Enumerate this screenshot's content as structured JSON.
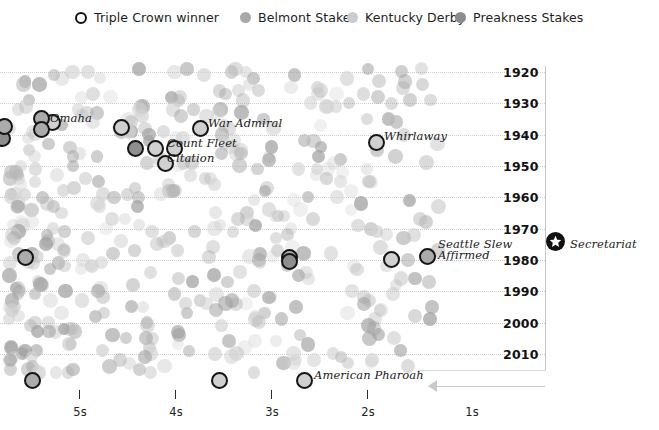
{
  "legend": {
    "items": [
      {
        "name": "triple-crown-winner",
        "label": "Triple Crown winner",
        "marker": "ring",
        "color": "#101010",
        "x": 75
      },
      {
        "name": "belmont-stakes",
        "label": "Belmont Stakes",
        "marker": "dot",
        "color": "#a8a8a8",
        "x": 240
      },
      {
        "name": "kentucky-derby",
        "label": "Kentucky Derby",
        "marker": "dot",
        "color": "#c9c9c9",
        "x": 347
      },
      {
        "name": "preakness-stakes",
        "label": "Preakness Stakes",
        "marker": "dot",
        "color": "#8c8c8c",
        "x": 455
      }
    ]
  },
  "axes": {
    "y": {
      "name": "year-axis",
      "ticks": [
        "1920",
        "1930",
        "1940",
        "1950",
        "1960",
        "1970",
        "1980",
        "1990",
        "2000",
        "2010"
      ],
      "min": 1920,
      "max": 2010
    },
    "x": {
      "name": "margin-axis",
      "ticks": [
        "5s",
        "4s",
        "3s",
        "2s",
        "1s"
      ],
      "direction_hint": "arrow-left"
    }
  },
  "chart_data": {
    "type": "scatter",
    "title": "",
    "xlabel": "",
    "ylabel": "",
    "xlim": [
      5.6,
      0.4
    ],
    "ylim": [
      1917,
      2016
    ],
    "grid": true,
    "legend_position": "top",
    "series": [
      {
        "name": "Belmont Stakes",
        "color": "#a8a8a8"
      },
      {
        "name": "Kentucky Derby",
        "color": "#c9c9c9"
      },
      {
        "name": "Preakness Stakes",
        "color": "#8c8c8c"
      }
    ],
    "annotations": [
      {
        "label": "Omaha",
        "year": 1935,
        "x_px": 120,
        "y_px": 118
      },
      {
        "label": "War Admiral",
        "year": 1937,
        "x_px": 207,
        "y_px": 123
      },
      {
        "label": "Count Fleet",
        "year": 1943,
        "x_px": 166,
        "y_px": 143
      },
      {
        "label": "Citation",
        "year": 1948,
        "x_px": 166,
        "y_px": 158
      },
      {
        "label": "Whirlaway",
        "year": 1941,
        "x_px": 383,
        "y_px": 136
      },
      {
        "label": "Seattle Slew",
        "year": 1977,
        "x_px": 437,
        "y_px": 244
      },
      {
        "label": "Affirmed",
        "year": 1978,
        "x_px": 437,
        "y_px": 254
      },
      {
        "label": "American Pharoah",
        "year": 2015,
        "x_px": 313,
        "y_px": 375
      },
      {
        "label": "Secretariat",
        "year": 1973,
        "x_px": 572,
        "y_px": 238
      }
    ],
    "triple_crown_winners": [
      {
        "label": "Sir Barton",
        "x_px": 46,
        "y_px": 118
      },
      {
        "label": "Gallant Fox",
        "x_px": 2,
        "y_px": 133
      },
      {
        "label": "Omaha",
        "x_px": 38,
        "y_px": 113
      },
      {
        "label": "Omaha-b",
        "x_px": 38,
        "y_px": 124
      },
      {
        "label": "War Admiral",
        "x_px": 194,
        "y_px": 123
      },
      {
        "label": "Whirlaway",
        "x_px": 370,
        "y_px": 136
      },
      {
        "label": "Count Fleet",
        "x_px": 153,
        "y_px": 143
      },
      {
        "label": "Assault",
        "x_px": 119,
        "y_px": 122
      },
      {
        "label": "Citation",
        "x_px": 156,
        "y_px": 158
      },
      {
        "label": "Count Fleet-b",
        "x_px": 134,
        "y_px": 143
      },
      {
        "label": "Secretariat-dot",
        "x_px": 22,
        "y_px": 252
      },
      {
        "label": "Seattle Slew",
        "x_px": 287,
        "y_px": 252
      },
      {
        "label": "Affirmed",
        "x_px": 287,
        "y_px": 256
      },
      {
        "label": "Spectacular",
        "x_px": 389,
        "y_px": 253
      },
      {
        "label": "Affirmed-b",
        "x_px": 425,
        "y_px": 251
      },
      {
        "label": "Bottom1",
        "x_px": 29,
        "y_px": 375
      },
      {
        "label": "Bottom2",
        "x_px": 216,
        "y_px": 375
      },
      {
        "label": "American Pharoah",
        "x_px": 301,
        "y_px": 375
      }
    ],
    "note": "Each faint dot is one horse's finishing margin in a Triple Crown race; outlined rings mark Triple Crown winners; the star marks Secretariat."
  }
}
